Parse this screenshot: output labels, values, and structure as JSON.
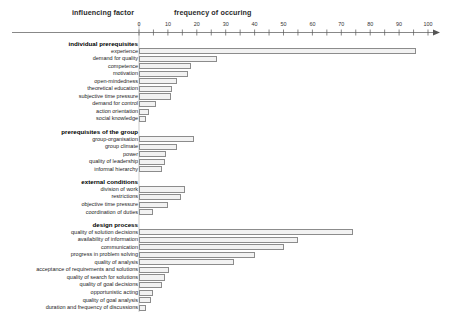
{
  "header": {
    "left_title": "influencing factor",
    "right_title": "frequency of occuring"
  },
  "chart_data": {
    "type": "bar",
    "orientation": "horizontal",
    "title": "",
    "xlabel": "frequency of occuring",
    "ylabel": "influencing factor",
    "xlim": [
      0,
      100
    ],
    "xticks": [
      0,
      10,
      20,
      30,
      40,
      50,
      60,
      70,
      80,
      90,
      100
    ],
    "minor_tick_step": 5,
    "grid": false,
    "legend": false,
    "bar_fill": "#f2f2f2",
    "bar_stroke": "#8c8c8c",
    "groups": [
      {
        "name": "individual prerequisites",
        "categories": [
          "experience",
          "demand for quality",
          "competence",
          "motivation",
          "open-mindedness",
          "theoretical education",
          "subjective time pressure",
          "demand for control",
          "action orientation",
          "social knowledge"
        ],
        "values": [
          96,
          27,
          18,
          17,
          13,
          11.5,
          11,
          6,
          3.5,
          2.5
        ]
      },
      {
        "name": "prerequisites of the group",
        "categories": [
          "group-organisation",
          "group climate",
          "power",
          "quality of leadership",
          "informal hierarchy"
        ],
        "values": [
          19,
          13,
          9.5,
          9,
          8
        ]
      },
      {
        "name": "external conditions",
        "categories": [
          "division of work",
          "restrictions",
          "objective time pressure",
          "coordination of duties"
        ],
        "values": [
          16,
          14.5,
          10,
          5
        ]
      },
      {
        "name": "design process",
        "categories": [
          "quality of solution decisions",
          "availability of information",
          "communication",
          "progress in problem solving",
          "quality of analysis",
          "acceptance of requirements and solutions",
          "quality of search for solutions",
          "quality of goal decisions",
          "opportunistic acting",
          "quality of goal analysis",
          "duration and frequency of discussions"
        ],
        "values": [
          74,
          55,
          50,
          40,
          33,
          10.5,
          9,
          8,
          5,
          4,
          2.5
        ]
      }
    ]
  }
}
